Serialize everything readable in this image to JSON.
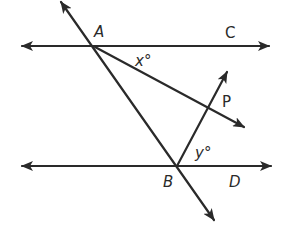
{
  "diagram": {
    "type": "geometry",
    "colors": {
      "stroke": "#2a2a2a",
      "background": "#ffffff"
    },
    "points": {
      "A": {
        "label": "A",
        "x": 95,
        "y": 47
      },
      "B": {
        "label": "B",
        "x": 177,
        "y": 166
      },
      "C": {
        "label": "C",
        "x": 232,
        "y": 36
      },
      "D": {
        "label": "D",
        "x": 234,
        "y": 187
      },
      "P": {
        "label": "P",
        "x": 228,
        "y": 107
      }
    },
    "angles": {
      "x": {
        "label": "x°",
        "at": "A",
        "between": [
          "ray AC",
          "ray A→P direction"
        ]
      },
      "y": {
        "label": "y°",
        "at": "B",
        "between": [
          "line through B toward P",
          "ray BD"
        ]
      }
    },
    "lines": [
      {
        "name": "line-AC",
        "from": [
          20,
          46
        ],
        "to": [
          271,
          46
        ],
        "arrows": "both"
      },
      {
        "name": "line-BD",
        "from": [
          20,
          166
        ],
        "to": [
          273,
          166
        ],
        "arrows": "both"
      },
      {
        "name": "transversal-AB",
        "from": [
          60,
          0
        ],
        "to": [
          215,
          222
        ],
        "arrows": "both"
      },
      {
        "name": "ray-A-to-P",
        "from": [
          95,
          47
        ],
        "to": [
          246,
          128
        ],
        "arrows": "end"
      },
      {
        "name": "line-B-to-P",
        "from": [
          177,
          166
        ],
        "to": [
          228,
          70
        ],
        "arrows": "end"
      }
    ],
    "labels": {
      "A": "A",
      "B": "B",
      "C": "C",
      "D": "D",
      "P": "P",
      "x": "x°",
      "y": "y°"
    }
  }
}
